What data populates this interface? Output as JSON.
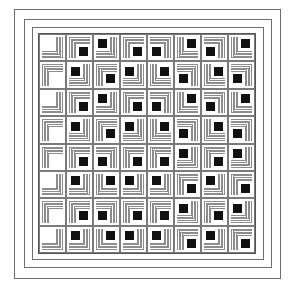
{
  "figure": {
    "type": "log-cabin-quilt",
    "rows": 8,
    "cols": 8,
    "colors": {
      "background": "#ffffff",
      "stripe": "#8c8c8c",
      "center": "#111111",
      "border_line": "#6e6e6e"
    },
    "border_frames": [
      {
        "left": 14,
        "top": 9,
        "right": 281,
        "bottom": 279
      },
      {
        "left": 24,
        "top": 19,
        "right": 272,
        "bottom": 268
      },
      {
        "left": 32,
        "top": 27,
        "right": 264,
        "bottom": 260
      },
      {
        "left": 38,
        "top": 33,
        "right": 256,
        "bottom": 254
      }
    ],
    "blocks": [
      [
        "BR*",
        "TL",
        "BR",
        "TL",
        "TR",
        "BL",
        "TR",
        "BL"
      ],
      [
        "TL*",
        "BR",
        "TL",
        "BR",
        "BL",
        "TR",
        "BL",
        "TR"
      ],
      [
        "BR*",
        "TL",
        "BR",
        "TL",
        "TR",
        "BL",
        "TR",
        "BL"
      ],
      [
        "TL*",
        "BR",
        "TL",
        "BR",
        "BL",
        "TR",
        "BL",
        "TR"
      ],
      [
        "TL*",
        "TL",
        "TR",
        "TL",
        "TL",
        "BR",
        "TL",
        "BR"
      ],
      [
        "BR*",
        "BR",
        "BL",
        "BR",
        "BR",
        "TL",
        "BR",
        "TL"
      ],
      [
        "TL*",
        "TL",
        "TR",
        "TL",
        "TL",
        "BR",
        "TL",
        "BR"
      ],
      [
        "BR*",
        "BR",
        "BL",
        "BR",
        "BR",
        "TL",
        "BR",
        "TL"
      ]
    ]
  }
}
